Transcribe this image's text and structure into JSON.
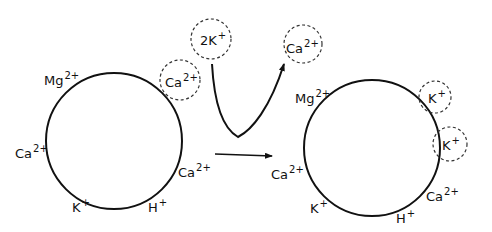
{
  "diagram": {
    "left_cell": {
      "ions": [
        {
          "id": "mg",
          "base": "Mg",
          "charge": "2+"
        },
        {
          "id": "ca_top",
          "base": "Ca",
          "charge": "2+"
        },
        {
          "id": "ca_left",
          "base": "Ca",
          "charge": "2+"
        },
        {
          "id": "ca_right",
          "base": "Ca",
          "charge": "2+"
        },
        {
          "id": "k",
          "base": "K",
          "charge": "+"
        },
        {
          "id": "h",
          "base": "H",
          "charge": "+"
        }
      ]
    },
    "exchange": {
      "incoming": {
        "base": "2K",
        "charge": "+"
      },
      "outgoing": {
        "base": "Ca",
        "charge": "2+"
      }
    },
    "right_cell": {
      "ions": [
        {
          "id": "mg",
          "base": "Mg",
          "charge": "2+"
        },
        {
          "id": "k_top",
          "base": "K",
          "charge": "+"
        },
        {
          "id": "k_right",
          "base": "K",
          "charge": "+"
        },
        {
          "id": "ca_left",
          "base": "Ca",
          "charge": "2+"
        },
        {
          "id": "ca_right",
          "base": "Ca",
          "charge": "2+"
        },
        {
          "id": "k",
          "base": "K",
          "charge": "+"
        },
        {
          "id": "h",
          "base": "H",
          "charge": "+"
        }
      ]
    },
    "colors": {
      "line": "#111111",
      "background": "#ffffff"
    }
  }
}
